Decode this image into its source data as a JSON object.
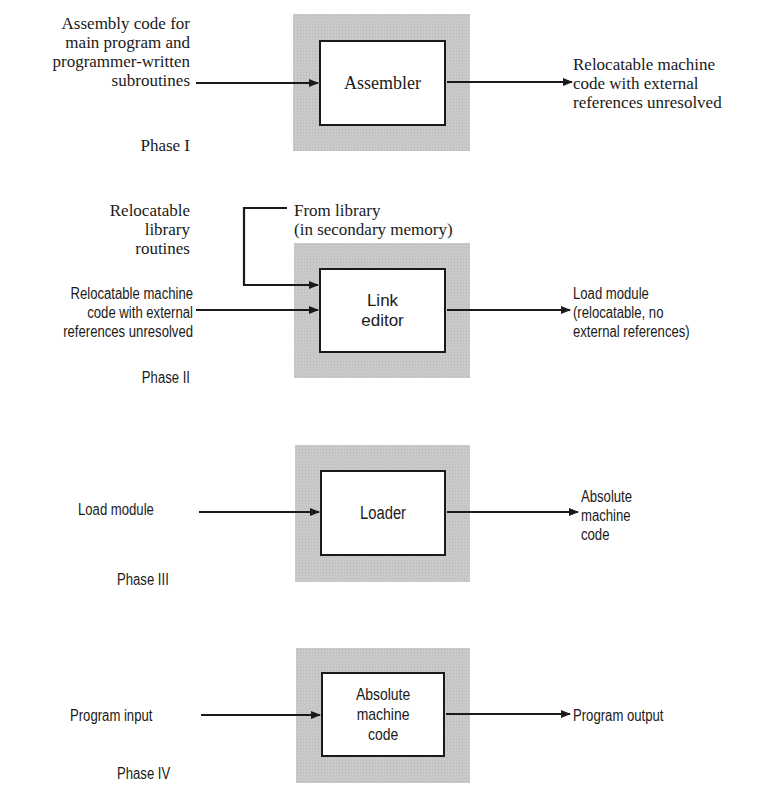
{
  "phases": [
    {
      "label": "Phase I",
      "process": "Assembler",
      "inputs": [
        "Assembly code for\nmain program and\nprogrammer-written\nsubroutines"
      ],
      "output": "Relocatable machine\ncode with external\nreferences unresolved"
    },
    {
      "label": "Phase II",
      "process": "Link\neditor",
      "side_label": "Relocatable\nlibrary\nroutines",
      "library_source": "From library\n(in secondary memory)",
      "inputs": [
        "Relocatable machine\ncode with external\nreferences unresolved"
      ],
      "output": "Load module\n(relocatable, no\nexternal references)"
    },
    {
      "label": "Phase III",
      "process": "Loader",
      "inputs": [
        "Load module"
      ],
      "output": "Absolute\nmachine\ncode"
    },
    {
      "label": "Phase IV",
      "process": "Absolute\nmachine\ncode",
      "inputs": [
        "Program input"
      ],
      "output": "Program output"
    }
  ],
  "colors": {
    "shade": "#c9c9c9",
    "ink": "#1a1a1a",
    "background": "#ffffff"
  }
}
